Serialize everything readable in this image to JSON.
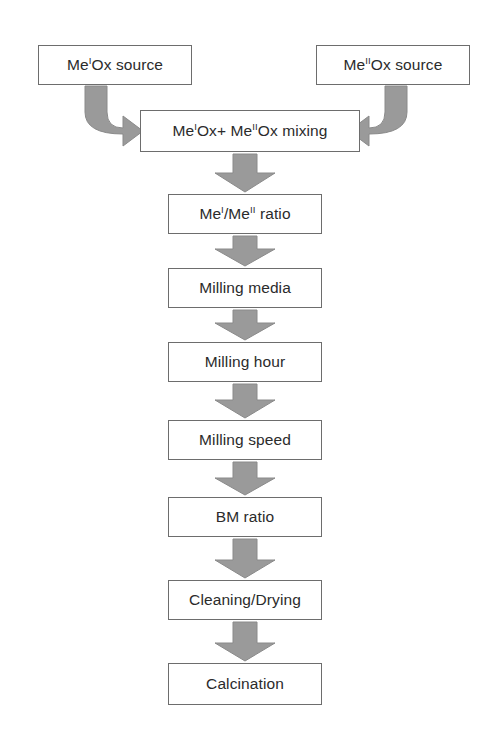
{
  "figure": {
    "kind": "process-flowchart",
    "title_visible": false,
    "background_color": "#ffffff",
    "box_border_color": "#6d6d6d",
    "box_fill_color": "#ffffff",
    "arrow_fill_color": "#9a9a9a",
    "arrow_stroke_color": "#8a8a8a",
    "text_color": "#2b2b2b"
  },
  "nodes": [
    {
      "id": "source-1",
      "label_html": "Me<sup>I</sup>Ox source",
      "label_text": "MeIOx source",
      "x": 38,
      "y": 45,
      "w": 154,
      "h": 40
    },
    {
      "id": "source-2",
      "label_html": "Me<sup>II</sup>Ox source",
      "label_text": "MeIIOx source",
      "x": 316,
      "y": 45,
      "w": 154,
      "h": 40
    },
    {
      "id": "mixing",
      "label_html": "Me<sup>I</sup>Ox+ Me<sup>II</sup>Ox mixing",
      "label_text": "MeIOx+ MeIIOx mixing",
      "x": 140,
      "y": 110,
      "w": 220,
      "h": 42
    },
    {
      "id": "ratio",
      "label_html": "Me<sup>I</sup>/Me<sup>II</sup> ratio",
      "label_text": "MeI/MeII ratio",
      "x": 168,
      "y": 194,
      "w": 154,
      "h": 40
    },
    {
      "id": "milling-media",
      "label_html": "Milling media",
      "label_text": "Milling media",
      "x": 168,
      "y": 268,
      "w": 154,
      "h": 40
    },
    {
      "id": "milling-hour",
      "label_html": "Milling hour",
      "label_text": "Milling hour",
      "x": 168,
      "y": 342,
      "w": 154,
      "h": 40
    },
    {
      "id": "milling-speed",
      "label_html": "Milling speed",
      "label_text": "Milling speed",
      "x": 168,
      "y": 420,
      "w": 154,
      "h": 40
    },
    {
      "id": "bm-ratio",
      "label_html": "BM ratio",
      "label_text": "BM ratio",
      "x": 168,
      "y": 497,
      "w": 154,
      "h": 40
    },
    {
      "id": "cleaning-drying",
      "label_html": "Cleaning/Drying",
      "label_text": "Cleaning/Drying",
      "x": 168,
      "y": 580,
      "w": 154,
      "h": 40
    },
    {
      "id": "calcination",
      "label_html": "Calcination",
      "label_text": "Calcination",
      "x": 168,
      "y": 663,
      "w": 154,
      "h": 42
    }
  ],
  "connectors": [
    {
      "id": "arrow-source1-to-mixing",
      "type": "elbow-right",
      "from": "source-1",
      "to": "mixing"
    },
    {
      "id": "arrow-source2-to-mixing",
      "type": "elbow-left",
      "from": "source-2",
      "to": "mixing"
    },
    {
      "id": "arrow-mixing-to-ratio",
      "type": "down",
      "from": "mixing",
      "to": "ratio"
    },
    {
      "id": "arrow-ratio-to-milling-media",
      "type": "down",
      "from": "ratio",
      "to": "milling-media"
    },
    {
      "id": "arrow-milling-media-to-milling-hour",
      "type": "down",
      "from": "milling-media",
      "to": "milling-hour"
    },
    {
      "id": "arrow-milling-hour-to-milling-speed",
      "type": "down",
      "from": "milling-hour",
      "to": "milling-speed"
    },
    {
      "id": "arrow-milling-speed-to-bm-ratio",
      "type": "down",
      "from": "milling-speed",
      "to": "bm-ratio"
    },
    {
      "id": "arrow-bm-ratio-to-cleaning-drying",
      "type": "down",
      "from": "bm-ratio",
      "to": "cleaning-drying"
    },
    {
      "id": "arrow-cleaning-drying-to-calcination",
      "type": "down",
      "from": "cleaning-drying",
      "to": "calcination"
    }
  ]
}
